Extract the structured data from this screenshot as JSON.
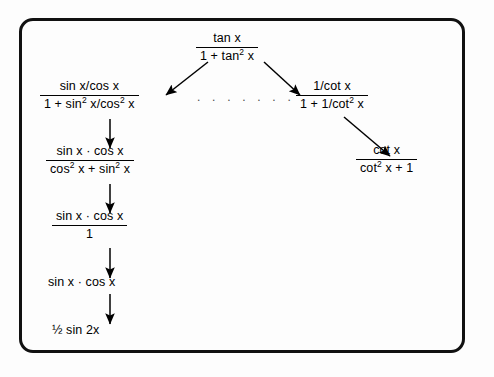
{
  "diagram": {
    "background_color": "#fdfdfd",
    "frame_color": "#111111",
    "text_color": "#000000",
    "ellipsis": ". . . . . . . .",
    "nodes": {
      "top": {
        "type": "fraction",
        "numerator": "tan x",
        "denominator_pre": "1 + tan",
        "denominator_sup": "2",
        "denominator_post": " x",
        "full": "tan x / (1 + tan² x)"
      },
      "left1": {
        "type": "fraction",
        "numerator": "sin x/cos x",
        "denominator_pre": "1 + sin",
        "denominator_sup": "2",
        "denominator_mid": " x/cos",
        "denominator_sup2": "2",
        "denominator_post": " x",
        "full": "(sin x/cos x) / (1 + sin² x/cos² x)"
      },
      "left2": {
        "type": "fraction",
        "numerator": "sin x · cos x",
        "denominator_pre": "cos",
        "denominator_sup": "2",
        "denominator_mid": " x + sin",
        "denominator_sup2": "2",
        "denominator_post": " x",
        "full": "(sin x · cos x) / (cos² x + sin² x)"
      },
      "left3": {
        "type": "fraction",
        "numerator": "sin x · cos x",
        "denominator": "1",
        "full": "(sin x · cos x) / 1"
      },
      "left4": {
        "type": "plain",
        "text": "sin x · cos x"
      },
      "left5": {
        "type": "plain",
        "text": "½ sin 2x"
      },
      "right1": {
        "type": "fraction",
        "numerator": "1/cot x",
        "denominator_pre": "1 + 1/cot",
        "denominator_sup": "2",
        "denominator_post": " x",
        "full": "(1/cot x) / (1 + 1/cot² x)"
      },
      "right2": {
        "type": "fraction",
        "numerator": "cot x",
        "denominator_pre": "cot",
        "denominator_sup": "2",
        "denominator_post": " x + 1",
        "full": "cot x / (cot² x + 1)"
      }
    }
  }
}
